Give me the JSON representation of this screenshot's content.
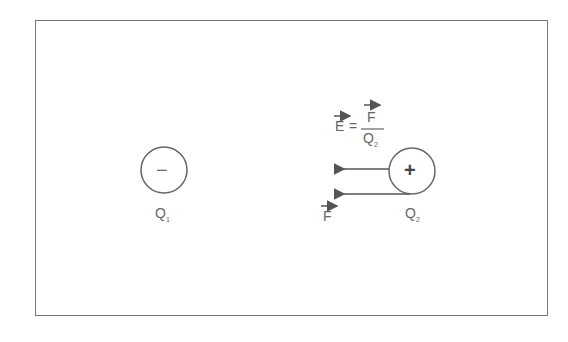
{
  "diagram": {
    "charge1": {
      "sign": "−",
      "label": "Q",
      "subscript": "1"
    },
    "charge2": {
      "sign": "+",
      "label": "Q",
      "subscript": "2"
    },
    "equation": {
      "lhs": "E",
      "equals": "=",
      "numerator": "F",
      "denominator": "Q",
      "denominator_sub": "2"
    },
    "force_label": "F",
    "colors": {
      "stroke": "#666666",
      "frame": "#777777"
    }
  }
}
